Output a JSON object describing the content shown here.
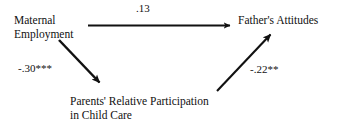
{
  "diagram": {
    "type": "path-model",
    "background_color": "#ffffff",
    "text_color": "#111111",
    "nodes": [
      {
        "id": "maternal_employment",
        "lines": [
          "Maternal",
          "Employment"
        ],
        "position": "left"
      },
      {
        "id": "fathers_attitudes",
        "lines": [
          "Father's Attitudes"
        ],
        "position": "right"
      },
      {
        "id": "parents_relative_participation",
        "lines": [
          "Parents' Relative Participation",
          "in Child Care"
        ],
        "position": "bottom-center"
      }
    ],
    "edges": [
      {
        "id": "me_to_fa",
        "from": "maternal_employment",
        "to": "fathers_attitudes",
        "label": ".13",
        "coefficient": 0.13,
        "significance": "",
        "direction": "horizontal-right"
      },
      {
        "id": "me_to_prp",
        "from": "maternal_employment",
        "to": "parents_relative_participation",
        "label": "-.30***",
        "coefficient": -0.3,
        "significance": "***",
        "direction": "diagonal-down-right"
      },
      {
        "id": "prp_to_fa",
        "from": "parents_relative_participation",
        "to": "fathers_attitudes",
        "label": "-.22**",
        "coefficient": -0.22,
        "significance": "**",
        "direction": "diagonal-up-right"
      }
    ]
  }
}
